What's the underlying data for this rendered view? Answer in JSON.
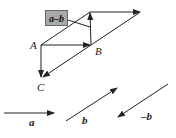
{
  "diagram": {
    "labels": {
      "box": "a–b",
      "A": "A",
      "B": "B",
      "C": "C",
      "a": "a",
      "b": "b",
      "neg_b": "–b"
    },
    "points": {
      "A": [
        41,
        45
      ],
      "B": [
        91,
        45
      ],
      "C": [
        41,
        78
      ],
      "top": [
        90,
        12
      ],
      "tip": [
        140,
        12
      ]
    },
    "colors": {
      "stroke": "#222222",
      "box_fill": "#a9a9a9"
    }
  }
}
